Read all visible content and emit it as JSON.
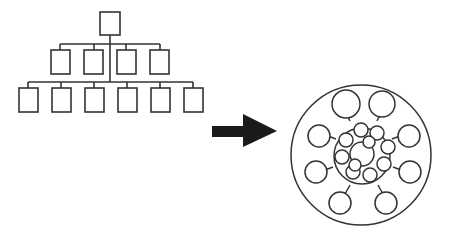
{
  "diagram": {
    "left": {
      "type": "hierarchy",
      "levels": [
        1,
        4,
        6
      ]
    },
    "arrow": {
      "direction": "right",
      "color": "#1a1a1a"
    },
    "right": {
      "type": "concentric-network",
      "center_nodes": 1,
      "inner_ring_nodes": 10,
      "outer_nodes": 8
    },
    "colors": {
      "stroke": "#333333",
      "background": "#ffffff"
    }
  }
}
